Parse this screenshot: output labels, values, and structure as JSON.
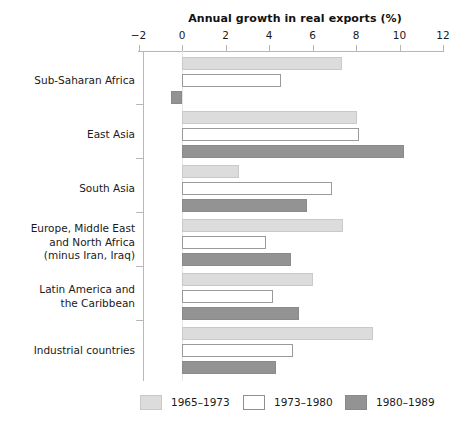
{
  "chart_data": {
    "type": "bar",
    "orientation": "horizontal",
    "title": "Annual growth in real exports (%)",
    "xlabel": "",
    "ylabel": "",
    "xlim": [
      -2,
      12
    ],
    "xticks": [
      -2,
      0,
      2,
      4,
      6,
      8,
      10,
      12
    ],
    "xtick_labels": [
      "−2",
      "0",
      "2",
      "4",
      "6",
      "8",
      "10",
      "12"
    ],
    "grid": false,
    "legend_position": "bottom",
    "categories": [
      "Sub-Saharan Africa",
      "East Asia",
      "South Asia",
      "Europe, Middle East\nand North Africa\n(minus Iran, Iraq)",
      "Latin America and\nthe Caribbean",
      "Industrial countries"
    ],
    "series": [
      {
        "name": "1965–1973",
        "color": "#dcdcdc",
        "values": [
          7.35,
          8.05,
          2.6,
          7.4,
          6.0,
          8.8
        ]
      },
      {
        "name": "1973–1980",
        "color": "#ffffff",
        "values": [
          4.55,
          8.15,
          6.9,
          3.85,
          4.2,
          5.1
        ]
      },
      {
        "name": "1980–1989",
        "color": "#939393",
        "values": [
          -0.5,
          10.2,
          5.75,
          5.0,
          5.4,
          4.3
        ]
      }
    ]
  },
  "legend": {
    "items": [
      {
        "label": "1965–1973",
        "swatch": "s0"
      },
      {
        "label": "1973–1980",
        "swatch": "s1"
      },
      {
        "label": "1980–1989",
        "swatch": "s2"
      }
    ]
  },
  "colors": {
    "series_1965_1973": "#dcdcdc",
    "series_1973_1980": "#ffffff",
    "series_1980_1989": "#939393",
    "axis": "#b6b6b6",
    "text": "#1a1a1a",
    "background": "#ffffff"
  }
}
